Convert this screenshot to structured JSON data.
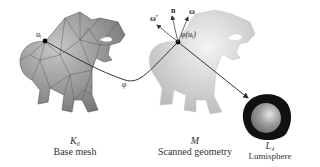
{
  "figure": {
    "panels": [
      {
        "id": "base-mesh",
        "symbol": "K₀",
        "caption": "Base mesh"
      },
      {
        "id": "scanned-geometry",
        "symbol": "M",
        "caption": "Scanned geometry"
      },
      {
        "id": "lumisphere",
        "symbol": "L₄",
        "caption": "Lumisphere"
      }
    ],
    "annotations": {
      "point_label": "uᵢ",
      "map_label": "φ",
      "mapped_point_label": "φ(uᵢ)",
      "normal_label": "n",
      "omega_label": "ω",
      "omega_reflected_label": "ω′"
    },
    "colors": {
      "mesh_fill": "#9a9a9a",
      "mesh_edges": "#555555",
      "scan_fill": "#d8d8d8",
      "curve": "#333333",
      "lumisphere_ring": "#111111",
      "lumisphere_sphere": "#9c9c9c"
    }
  }
}
